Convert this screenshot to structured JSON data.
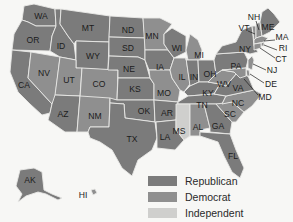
{
  "colors": {
    "republican": "#7b7b7b",
    "democrat": "#8f8f8f",
    "independent": "#cfcfcd",
    "background": "#f7f7f5"
  },
  "legend": {
    "items": [
      {
        "label": "Republican",
        "party": "republican",
        "color": "#7b7b7b"
      },
      {
        "label": "Democrat",
        "party": "democrat",
        "color": "#8f8f8f"
      },
      {
        "label": "Independent",
        "party": "independent",
        "color": "#cfcfcd"
      }
    ]
  },
  "states": [
    {
      "abbr": "WA",
      "party": "republican"
    },
    {
      "abbr": "OR",
      "party": "republican"
    },
    {
      "abbr": "CA",
      "party": "republican"
    },
    {
      "abbr": "ID",
      "party": "republican"
    },
    {
      "abbr": "NV",
      "party": "democrat"
    },
    {
      "abbr": "MT",
      "party": "republican"
    },
    {
      "abbr": "WY",
      "party": "republican"
    },
    {
      "abbr": "UT",
      "party": "democrat"
    },
    {
      "abbr": "AZ",
      "party": "republican"
    },
    {
      "abbr": "CO",
      "party": "democrat"
    },
    {
      "abbr": "NM",
      "party": "democrat"
    },
    {
      "abbr": "ND",
      "party": "republican"
    },
    {
      "abbr": "SD",
      "party": "republican"
    },
    {
      "abbr": "NE",
      "party": "republican"
    },
    {
      "abbr": "KS",
      "party": "republican"
    },
    {
      "abbr": "OK",
      "party": "republican"
    },
    {
      "abbr": "TX",
      "party": "republican"
    },
    {
      "abbr": "MN",
      "party": "democrat"
    },
    {
      "abbr": "IA",
      "party": "republican"
    },
    {
      "abbr": "MO",
      "party": "democrat"
    },
    {
      "abbr": "AR",
      "party": "republican"
    },
    {
      "abbr": "LA",
      "party": "republican"
    },
    {
      "abbr": "WI",
      "party": "republican"
    },
    {
      "abbr": "IL",
      "party": "democrat"
    },
    {
      "abbr": "MI",
      "party": "democrat"
    },
    {
      "abbr": "IN",
      "party": "republican"
    },
    {
      "abbr": "OH",
      "party": "republican"
    },
    {
      "abbr": "KY",
      "party": "republican"
    },
    {
      "abbr": "TN",
      "party": "republican"
    },
    {
      "abbr": "MS",
      "party": "independent"
    },
    {
      "abbr": "AL",
      "party": "democrat"
    },
    {
      "abbr": "GA",
      "party": "republican"
    },
    {
      "abbr": "FL",
      "party": "republican"
    },
    {
      "abbr": "SC",
      "party": "democrat"
    },
    {
      "abbr": "NC",
      "party": "democrat"
    },
    {
      "abbr": "VA",
      "party": "republican"
    },
    {
      "abbr": "WV",
      "party": "democrat"
    },
    {
      "abbr": "PA",
      "party": "republican"
    },
    {
      "abbr": "NY",
      "party": "republican"
    },
    {
      "abbr": "VT",
      "party": "democrat"
    },
    {
      "abbr": "NH",
      "party": "democrat"
    },
    {
      "abbr": "ME",
      "party": "republican"
    },
    {
      "abbr": "MA",
      "party": "democrat"
    },
    {
      "abbr": "RI",
      "party": "democrat"
    },
    {
      "abbr": "CT",
      "party": "democrat"
    },
    {
      "abbr": "NJ",
      "party": "democrat"
    },
    {
      "abbr": "DE",
      "party": "democrat"
    },
    {
      "abbr": "MD",
      "party": "democrat"
    },
    {
      "abbr": "AK",
      "party": "republican"
    },
    {
      "abbr": "HI",
      "party": "democrat"
    }
  ],
  "labels": {
    "WA": "WA",
    "OR": "OR",
    "CA": "CA",
    "ID": "ID",
    "NV": "NV",
    "MT": "MT",
    "WY": "WY",
    "UT": "UT",
    "AZ": "AZ",
    "CO": "CO",
    "NM": "NM",
    "ND": "ND",
    "SD": "SD",
    "NE": "NE",
    "KS": "KS",
    "OK": "OK",
    "TX": "TX",
    "MN": "MN",
    "IA": "IA",
    "MO": "MO",
    "AR": "AR",
    "LA": "LA",
    "WI": "WI",
    "IL": "IL",
    "MI": "MI",
    "IN": "IN",
    "OH": "OH",
    "KY": "KY",
    "TN": "TN",
    "MS": "MS",
    "AL": "AL",
    "GA": "GA",
    "FL": "FL",
    "SC": "SC",
    "NC": "NC",
    "VA": "VA",
    "WV": "WV",
    "PA": "PA",
    "NY": "NY",
    "VT": "VT",
    "NH": "NH",
    "ME": "ME",
    "MA": "MA",
    "RI": "RI",
    "CT": "CT",
    "NJ": "NJ",
    "DE": "DE",
    "MD": "MD",
    "AK": "AK",
    "HI": "HI"
  }
}
